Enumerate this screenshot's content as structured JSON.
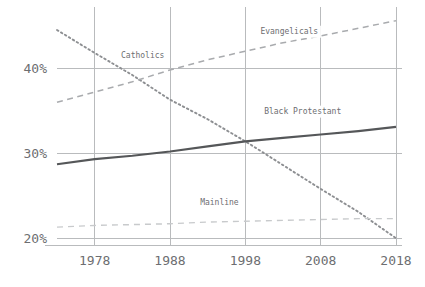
{
  "chart_data": {
    "type": "line",
    "title": "",
    "subtitle": "",
    "xlabel": "",
    "ylabel": "",
    "xlim": [
      1973,
      2018
    ],
    "ylim": [
      19.2,
      46.5
    ],
    "grid": true,
    "legend_position": "inline-labels",
    "x_ticks": [
      "1978",
      "1988",
      "1998",
      "2008",
      "2018"
    ],
    "x_tick_values": [
      1978,
      1988,
      1998,
      2008,
      2018
    ],
    "y_ticks": [
      "20%",
      "30%",
      "40%"
    ],
    "y_tick_values": [
      20,
      30,
      40
    ],
    "series": [
      {
        "name": "Catholics",
        "label": "Catholics",
        "style": "dotted",
        "color": "#8d8f92",
        "x": [
          1973,
          1978,
          1983,
          1988,
          1993,
          1998,
          2003,
          2008,
          2013,
          2018
        ],
        "values": [
          44.5,
          41.8,
          39.2,
          36.3,
          34.0,
          31.4,
          28.6,
          25.8,
          23.1,
          20.0
        ],
        "label_x": 1981.5,
        "label_y": 41.2
      },
      {
        "name": "Evangelicals",
        "label": "Evangelicals",
        "style": "dashed",
        "color": "#a9abae",
        "x": [
          1973,
          1978,
          1983,
          1988,
          1993,
          1998,
          2003,
          2008,
          2013,
          2018
        ],
        "values": [
          36.0,
          37.2,
          38.4,
          39.8,
          41.0,
          42.0,
          43.0,
          43.8,
          44.7,
          45.6
        ],
        "label_x": 2000.0,
        "label_y": 44.0
      },
      {
        "name": "Black Protestant",
        "label": "Black Protestant",
        "style": "solid",
        "color": "#555759",
        "x": [
          1973,
          1978,
          1983,
          1988,
          1993,
          1998,
          2003,
          2008,
          2013,
          2018
        ],
        "values": [
          28.7,
          29.3,
          29.7,
          30.2,
          30.8,
          31.4,
          31.8,
          32.2,
          32.6,
          33.1
        ],
        "label_x": 2000.5,
        "label_y": 34.6
      },
      {
        "name": "Mainline",
        "label": "Mainline",
        "style": "dashed-light",
        "color": "#c8cacc",
        "x": [
          1973,
          1978,
          1983,
          1988,
          1993,
          1998,
          2003,
          2008,
          2013,
          2018
        ],
        "values": [
          21.3,
          21.5,
          21.6,
          21.7,
          21.9,
          22.0,
          22.1,
          22.2,
          22.3,
          22.3
        ],
        "label_x": 1992.0,
        "label_y": 23.9
      }
    ],
    "colors": {
      "grid": "#b9bbbd",
      "axis": "#b9bbbd",
      "tick_text": "#6d6e71",
      "label_text": "#6d6e71",
      "background": "#ffffff"
    }
  }
}
